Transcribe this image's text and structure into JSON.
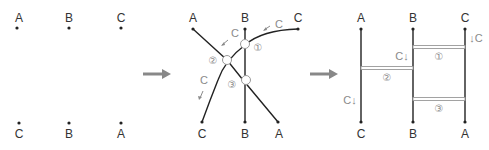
{
  "panel1": {
    "top_labels": [
      "A",
      "B",
      "C"
    ],
    "bottom_labels": [
      "C",
      "B",
      "A"
    ]
  },
  "panel2": {
    "top_labels": [
      "A",
      "B",
      "C"
    ],
    "bottom_labels": [
      "C",
      "B",
      "A"
    ],
    "crossing_numbers": [
      "①",
      "②",
      "③"
    ],
    "flow_labels": [
      "C",
      "C",
      "C"
    ]
  },
  "panel3": {
    "top_labels": [
      "A",
      "B",
      "C"
    ],
    "bottom_labels": [
      "C",
      "B",
      "A"
    ],
    "rung_numbers": [
      "①",
      "②",
      "③"
    ],
    "flow_labels": [
      "C↓",
      "C↓",
      "↓C"
    ]
  },
  "colors": {
    "line": "#222222",
    "accent_gray": "#8a8a8a",
    "arrow": "#888888"
  }
}
